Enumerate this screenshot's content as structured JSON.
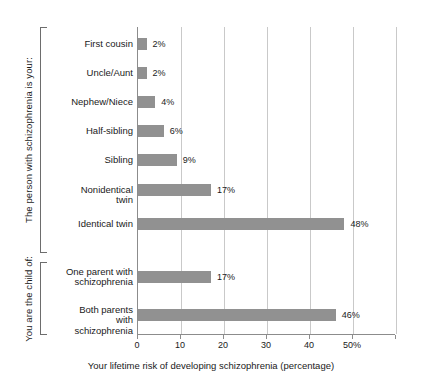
{
  "chart_data": {
    "type": "bar",
    "orientation": "horizontal",
    "title": "",
    "xlabel": "Your lifetime risk of developing schizophrenia (percentage)",
    "ylabel": "",
    "xlim": [
      0,
      60
    ],
    "grid": true,
    "legend": false,
    "bar_color": "#919191",
    "xticks": [
      {
        "value": 0,
        "label": "0"
      },
      {
        "value": 10,
        "label": "10"
      },
      {
        "value": 20,
        "label": "20"
      },
      {
        "value": 30,
        "label": "30"
      },
      {
        "value": 40,
        "label": "40"
      },
      {
        "value": 50,
        "label": "50%"
      },
      {
        "value": 60,
        "label": ""
      }
    ],
    "categories": [
      "First cousin",
      "Uncle/Aunt",
      "Nephew/Niece",
      "Half-sibling",
      "Sibling",
      "Nonidentical twin",
      "Identical twin",
      "One parent with schizophrenia",
      "Both parents with schizophrenia"
    ],
    "values": [
      2,
      2,
      4,
      6,
      9,
      17,
      48,
      17,
      46
    ],
    "value_labels": [
      "2%",
      "2%",
      "4%",
      "6%",
      "9%",
      "17%",
      "48%",
      "17%",
      "46%"
    ],
    "groups": [
      {
        "label": "The person with schizophrenia is your:",
        "categories": [
          "First cousin",
          "Uncle/Aunt",
          "Nephew/Niece",
          "Half-sibling",
          "Sibling",
          "Nonidentical twin",
          "Identical twin"
        ]
      },
      {
        "label": "You are the child of:",
        "categories": [
          "One parent with schizophrenia",
          "Both parents with schizophrenia"
        ]
      }
    ]
  }
}
